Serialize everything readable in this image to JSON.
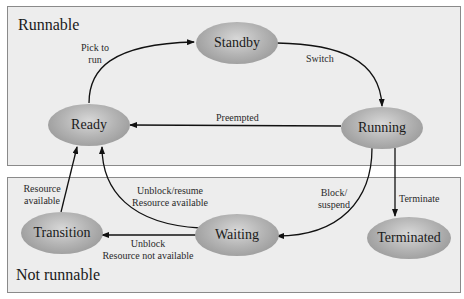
{
  "regions": {
    "runnable": {
      "title": "Runnable"
    },
    "not_runnable": {
      "title": "Not runnable"
    }
  },
  "states": {
    "standby": "Standby",
    "ready": "Ready",
    "running": "Running",
    "transition": "Transition",
    "waiting": "Waiting",
    "terminated": "Terminated"
  },
  "transitions": {
    "pick_to_run": {
      "line1": "Pick to",
      "line2": "run",
      "from": "Ready",
      "to": "Standby"
    },
    "switch": {
      "label": "Switch",
      "from": "Standby",
      "to": "Running"
    },
    "preempted": {
      "label": "Preempted",
      "from": "Running",
      "to": "Ready"
    },
    "block_suspend": {
      "line1": "Block/",
      "line2": "suspend",
      "from": "Running",
      "to": "Waiting"
    },
    "terminate": {
      "label": "Terminate",
      "from": "Running",
      "to": "Terminated"
    },
    "unblock_resume": {
      "line1": "Unblock/resume",
      "line2": "Resource available",
      "from": "Waiting",
      "to": "Ready"
    },
    "unblock_not_available": {
      "line1": "Unblock",
      "line2": "Resource not available",
      "from": "Waiting",
      "to": "Transition"
    },
    "resource_available": {
      "line1": "Resource",
      "line2": "available",
      "from": "Transition",
      "to": "Ready"
    }
  },
  "colors": {
    "region_fill": "#ededed",
    "region_border": "#8a8a8a",
    "edge": "#111111",
    "node_mid": "#b4b4b4"
  }
}
